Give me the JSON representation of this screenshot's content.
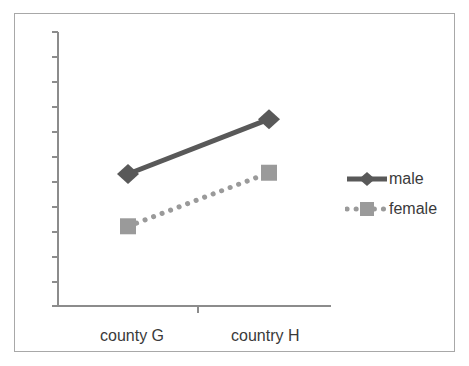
{
  "chart_data": {
    "type": "line",
    "title": "",
    "xlabel": "",
    "ylabel": "",
    "categories": [
      "county G",
      "country H"
    ],
    "series": [
      {
        "name": "male",
        "values": [
          5.3,
          7.5
        ],
        "color": "#595959",
        "marker": "diamond",
        "linestyle": "solid"
      },
      {
        "name": "female",
        "values": [
          3.2,
          5.35
        ],
        "color": "#9a9a9a",
        "marker": "square",
        "linestyle": "dotted"
      }
    ],
    "ylim": [
      0,
      11
    ],
    "yticks": [
      0,
      1,
      2,
      3,
      4,
      5,
      6,
      7,
      8,
      9,
      10,
      11
    ],
    "ytick_labels": [
      "",
      "",
      "",
      "",
      "",
      "",
      "",
      "",
      "",
      "",
      "",
      ""
    ],
    "grid": false,
    "legend_position": "right"
  },
  "axes": {
    "y_axis_name": "y-axis",
    "x_axis_name": "x-axis"
  },
  "legend": {
    "entries": [
      {
        "label": "male"
      },
      {
        "label": "female"
      }
    ]
  },
  "colors": {
    "male_series": "#595959",
    "female_series": "#9a9a9a",
    "axis": "#8c8c8c",
    "frame_border": "#a8a8a8",
    "text": "#3a3a3a",
    "background": "#ffffff"
  }
}
